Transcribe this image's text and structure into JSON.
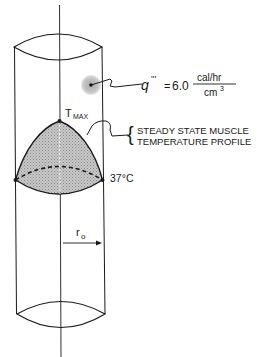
{
  "diagram": {
    "heat_generation": {
      "symbol": "q",
      "primes": "'''",
      "equals": "=",
      "value": "6.0",
      "unit_numerator": "cal/hr",
      "unit_denominator": "cm",
      "unit_denominator_exp": "3"
    },
    "t_max": {
      "symbol": "T",
      "subscript": "MAX"
    },
    "profile_label": {
      "line1": "STEADY STATE MUSCLE",
      "line2": "TEMPERATURE PROFILE"
    },
    "boundary_temperature": "37°C",
    "radius": {
      "symbol": "r",
      "subscript": "o"
    },
    "colors": {
      "line": "#1a1a1a",
      "profile_fill": "#b8b8b8",
      "source_halo": "#c4c4c4"
    }
  }
}
